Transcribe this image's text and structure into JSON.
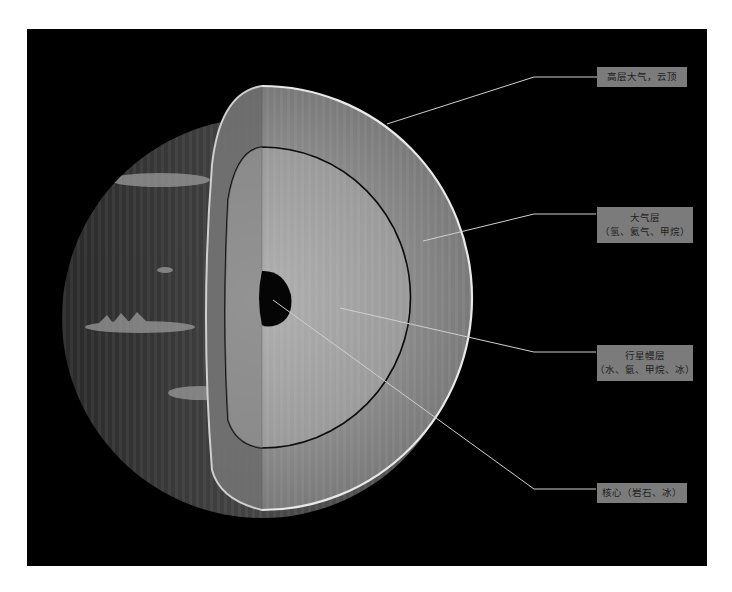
{
  "diagram": {
    "title": "",
    "colors": {
      "background": "#000000",
      "page": "#ffffff",
      "label_box": "#7b7b7b",
      "label_text": "#1e1e1e",
      "leader_line": "#cfcfcf",
      "shell_edge": "#e8e8e8"
    },
    "labels": [
      {
        "id": "upper-atmosphere",
        "lines": [
          "高层大气，云顶"
        ]
      },
      {
        "id": "atmosphere",
        "lines": [
          "大气层",
          "（氢、氦气、甲烷）"
        ]
      },
      {
        "id": "mantle",
        "lines": [
          "行星幔层",
          "（水、氨、甲烷、冰）"
        ]
      },
      {
        "id": "core",
        "lines": [
          "核心（岩石、冰）"
        ]
      }
    ]
  }
}
